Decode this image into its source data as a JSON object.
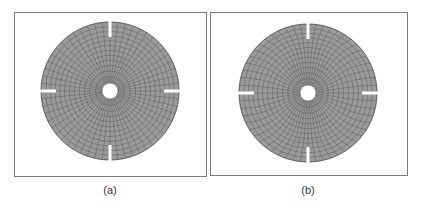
{
  "figure": {
    "background": "#ffffff",
    "frame_color": "#7a7a7a",
    "mesh_fill": "#9a9a9a",
    "mesh_line": "#4a4a4a",
    "panels": [
      {
        "id": "a",
        "caption": "(a)",
        "frame": {
          "x": 14,
          "y": 12,
          "w": 193,
          "h": 165
        },
        "disk": {
          "cx": 110,
          "cy": 91,
          "r_outer": 69,
          "r_inner": 8
        },
        "rings": 12,
        "spokes": 56,
        "twist": 0,
        "slots": {
          "width": 3,
          "length": 15,
          "directions": [
            "top",
            "right",
            "bottom",
            "left"
          ]
        },
        "caption_pos": {
          "x": 110,
          "y": 190
        }
      },
      {
        "id": "b",
        "caption": "(b)",
        "frame": {
          "x": 210,
          "y": 12,
          "w": 198,
          "h": 164
        },
        "disk": {
          "cx": 308,
          "cy": 93,
          "r_outer": 69,
          "r_inner": 8
        },
        "rings": 12,
        "spokes": 56,
        "twist": 0.12,
        "slots": {
          "width": 3,
          "length": 15,
          "directions": [
            "top",
            "right",
            "bottom",
            "left"
          ]
        },
        "caption_pos": {
          "x": 308,
          "y": 190
        }
      }
    ]
  }
}
